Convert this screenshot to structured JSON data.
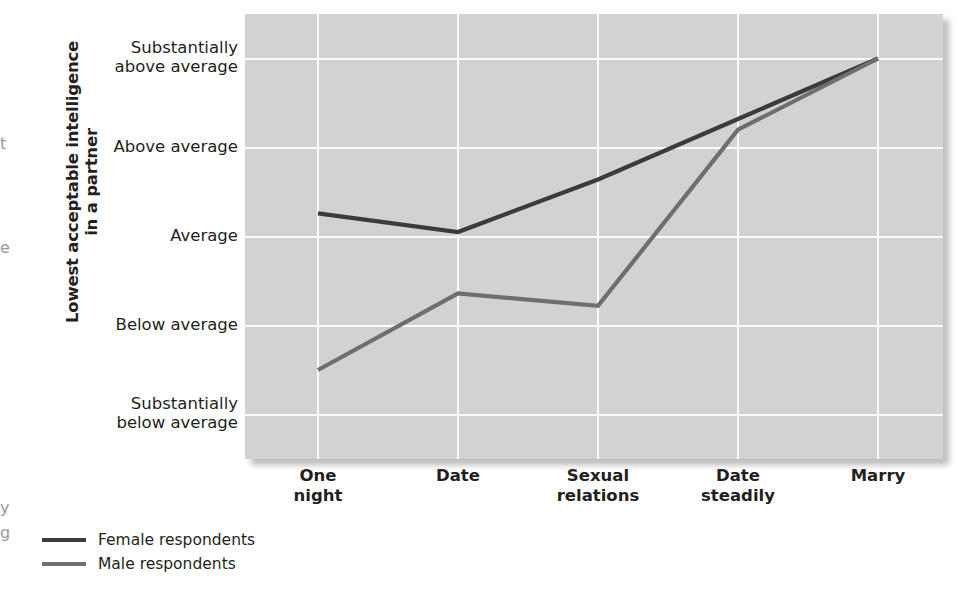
{
  "chart_data": {
    "type": "line",
    "title": "",
    "subtitle": "",
    "xlabel": "",
    "ylabel": "Lowest acceptable intelligence in a partner",
    "categories": [
      "One night",
      "Date",
      "Sexual relations",
      "Date steadily",
      "Marry"
    ],
    "x_tick_lines": [
      "One\nnight",
      "Date",
      "Sexual\nrelations",
      "Date\nsteadily",
      "Marry"
    ],
    "y_tick_labels": [
      "Substantially\nabove average",
      "Above average",
      "Average",
      "Below average",
      "Substantially\nbelow average"
    ],
    "y_scale_values": [
      5,
      4,
      3,
      2,
      1
    ],
    "ylim": [
      0.5,
      5.5
    ],
    "grid": true,
    "legend_position": "below-left",
    "series": [
      {
        "name": "Female respondents",
        "color": "#3b3b3b",
        "values": [
          3.26,
          3.05,
          3.64,
          4.32,
          5.0
        ]
      },
      {
        "name": "Male respondents",
        "color": "#6e6e6e",
        "values": [
          1.5,
          2.36,
          2.22,
          4.2,
          5.0
        ]
      }
    ],
    "colors": {
      "plot_background": "#d2d2d2",
      "gridline": "#fbfbfb",
      "text": "#231f20",
      "female_line": "#3b3b3b",
      "male_line": "#6e6e6e"
    }
  },
  "axis": {
    "y_title_line1": "Lowest acceptable intelligence",
    "y_title_line2": "in a partner"
  },
  "legend": {
    "items": [
      {
        "label": "Female respondents",
        "color": "#3b3b3b"
      },
      {
        "label": "Male respondents",
        "color": "#6e6e6e"
      }
    ]
  },
  "edge_fragments": {
    "left_top": "t",
    "left_mid": "e",
    "left_bottom_1": "y",
    "left_bottom_2": "g"
  }
}
